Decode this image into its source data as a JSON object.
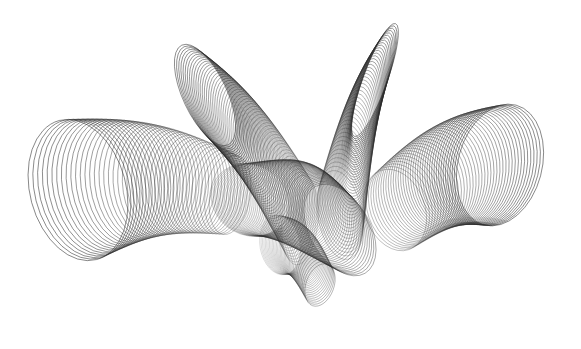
{
  "canvas": {
    "width": 581,
    "height": 349,
    "background": "#ffffff"
  },
  "artwork": {
    "kind": "generative-ellipse-sweep",
    "stroke_color": "#2a2a2a",
    "stroke_width": 0.6,
    "groups": [
      {
        "name": "left-wing",
        "count": 40,
        "opacity": [
          0.85,
          0.45
        ],
        "cx": [
          78,
          230
        ],
        "cy": [
          190,
          195
        ],
        "rx": [
          48,
          20
        ],
        "ry": [
          72,
          40
        ],
        "rot": [
          -15,
          10
        ]
      },
      {
        "name": "upper-left-fan",
        "count": 55,
        "opacity": [
          0.8,
          0.35
        ],
        "cx": [
          205,
          300
        ],
        "cy": [
          95,
          220
        ],
        "rx": [
          22,
          18
        ],
        "ry": [
          55,
          45
        ],
        "rot": [
          -25,
          5
        ]
      },
      {
        "name": "center-mesh",
        "count": 50,
        "opacity": [
          0.35,
          0.6
        ],
        "cx": [
          250,
          340
        ],
        "cy": [
          200,
          230
        ],
        "rx": [
          40,
          30
        ],
        "ry": [
          35,
          50
        ],
        "rot": [
          30,
          -30
        ]
      },
      {
        "name": "tall-right-petal",
        "count": 45,
        "opacity": [
          0.8,
          0.4
        ],
        "cx": [
          375,
          340
        ],
        "cy": [
          80,
          215
        ],
        "rx": [
          12,
          22
        ],
        "ry": [
          60,
          45
        ],
        "rot": [
          20,
          -10
        ]
      },
      {
        "name": "right-wing",
        "count": 40,
        "opacity": [
          0.45,
          0.85
        ],
        "cx": [
          395,
          500
        ],
        "cy": [
          210,
          165
        ],
        "rx": [
          30,
          42
        ],
        "ry": [
          42,
          62
        ],
        "rot": [
          -20,
          15
        ]
      },
      {
        "name": "bottom-lobe",
        "count": 35,
        "opacity": [
          0.25,
          0.5
        ],
        "cx": [
          280,
          320
        ],
        "cy": [
          245,
          285
        ],
        "rx": [
          20,
          14
        ],
        "ry": [
          30,
          22
        ],
        "rot": [
          -10,
          20
        ]
      }
    ]
  }
}
